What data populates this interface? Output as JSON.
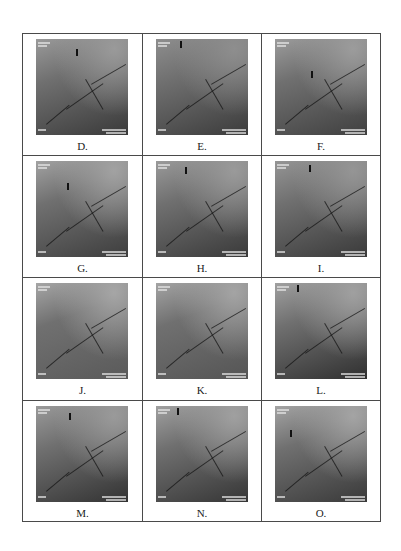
{
  "figure": {
    "panels": [
      {
        "label": "D.",
        "tone": [
          "#9a9a9a",
          "#3a3a3a"
        ],
        "marker": [
          40,
          10
        ]
      },
      {
        "label": "E.",
        "tone": [
          "#8e8e8e",
          "#3c3c3c"
        ],
        "marker": [
          24,
          2
        ]
      },
      {
        "label": "F.",
        "tone": [
          "#9c9c9c",
          "#404040"
        ],
        "marker": [
          36,
          32
        ]
      },
      {
        "label": "G.",
        "tone": [
          "#a2a2a2",
          "#3e3e3e"
        ],
        "marker": [
          31,
          22
        ]
      },
      {
        "label": "H.",
        "tone": [
          "#9a9a9a",
          "#3a3a3a"
        ],
        "marker": [
          29,
          6
        ]
      },
      {
        "label": "I.",
        "tone": [
          "#959595",
          "#3a3a3a"
        ],
        "marker": [
          34,
          4
        ]
      },
      {
        "label": "J.",
        "tone": [
          "#a6a6a6",
          "#5a5a5a"
        ],
        "marker": [
          0,
          0
        ]
      },
      {
        "label": "K.",
        "tone": [
          "#a4a4a4",
          "#555555"
        ],
        "marker": [
          0,
          0
        ]
      },
      {
        "label": "L.",
        "tone": [
          "#a0a0a0",
          "#303030"
        ],
        "marker": [
          22,
          2
        ]
      },
      {
        "label": "M.",
        "tone": [
          "#9a9a9a",
          "#333333"
        ],
        "marker": [
          33,
          7
        ]
      },
      {
        "label": "N.",
        "tone": [
          "#a0a0a0",
          "#363636"
        ],
        "marker": [
          21,
          2
        ]
      },
      {
        "label": "O.",
        "tone": [
          "#a4a4a4",
          "#3a3a3a"
        ],
        "marker": [
          15,
          24
        ]
      }
    ]
  }
}
